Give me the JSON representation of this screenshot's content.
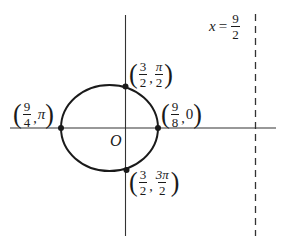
{
  "diagram": {
    "type": "polar-conic-ellipse",
    "origin_label": "O",
    "directrix": {
      "label_var": "x",
      "label_eq": "=",
      "label_num": "9",
      "label_den": "2"
    },
    "points": [
      {
        "id": "top",
        "r_num": "3",
        "r_den": "2",
        "theta_num": "π",
        "theta_den": "2"
      },
      {
        "id": "right",
        "r_num": "9",
        "r_den": "8",
        "theta": "0"
      },
      {
        "id": "left",
        "r_num": "9",
        "r_den": "4",
        "theta": "π"
      },
      {
        "id": "bottom",
        "r_num": "3",
        "r_den": "2",
        "theta_num": "3π",
        "theta_den": "2"
      }
    ],
    "colors": {
      "stroke": "#1a1a1a",
      "background": "#ffffff"
    }
  }
}
